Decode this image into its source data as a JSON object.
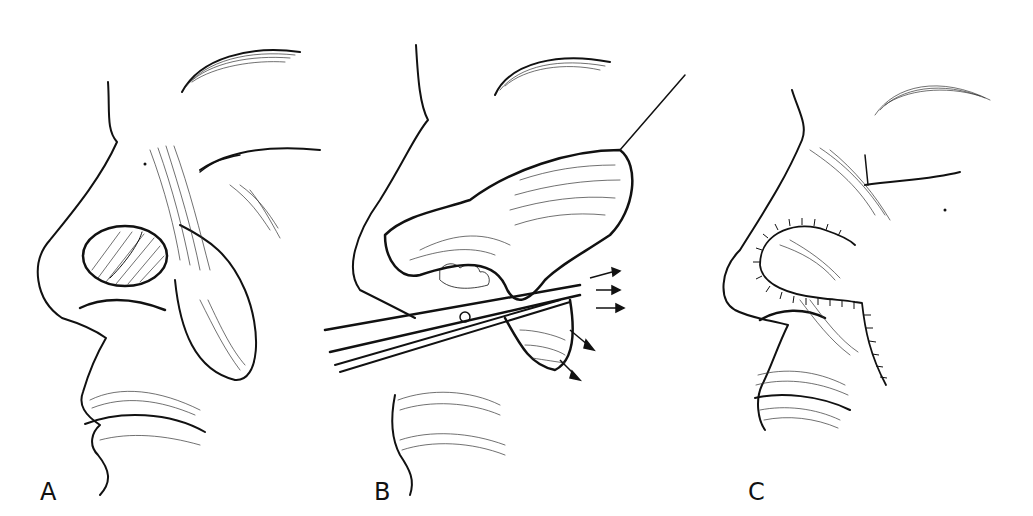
{
  "figure": {
    "type": "medical-illustration",
    "panels": [
      {
        "id": "A",
        "label": "A",
        "description": "Profile of nose with oval defect on nasal ala; outline of cheek flap drawn on nasolabial region"
      },
      {
        "id": "B",
        "label": "B",
        "description": "Flap elevated with hook retractor; scissors undermining; arrows showing direction of advancement"
      },
      {
        "id": "C",
        "label": "C",
        "description": "Flap sutured into the alar defect; sutured closure along nasolabial fold"
      }
    ],
    "caption_partial": "",
    "colors": {
      "ink": "#111111",
      "background": "#ffffff"
    }
  }
}
